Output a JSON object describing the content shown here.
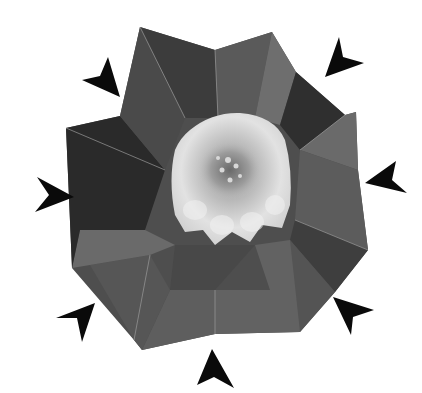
{
  "image": {
    "description": "Grayscale photograph of an origami flower with seven-fold folded petals, surrounded by seven black arrowheads pointing inward toward the flower",
    "background": "#ffffff",
    "subject": "origami flower",
    "petal_count": 7,
    "arrow_count": 7,
    "colors": {
      "arrow": "#0a0a0a",
      "petal_dark": "#3a3a3a",
      "petal_mid": "#5c5c5c",
      "petal_light": "#8a8a8a",
      "bloom_light": "#e4e4e4",
      "bloom_center": "#9a9a9a"
    },
    "arrows": [
      {
        "position": "top-left",
        "points": "120,97 108,57 100,76 82,80"
      },
      {
        "position": "top-right",
        "points": "325,77 339,37 343,57 364,63"
      },
      {
        "position": "right",
        "points": "365,183 396,161 392,180 407,193"
      },
      {
        "position": "bottom-right",
        "points": "333,297 374,310 353,317 351,335"
      },
      {
        "position": "bottom",
        "points": "212,349 234,388 214,377 197,385"
      },
      {
        "position": "bottom-left",
        "points": "95,303 82,342 77,318 56,318"
      },
      {
        "position": "left",
        "points": "74,197 35,212 49,195 37,177"
      }
    ]
  }
}
